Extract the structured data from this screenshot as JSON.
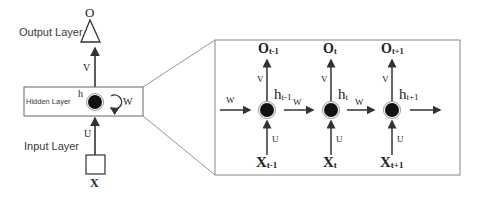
{
  "colors": {
    "line": "#333333",
    "frame": "#888888",
    "neuron_fill": "#111111",
    "neuron_ring": "#999999",
    "background": "#ffffff"
  },
  "folded": {
    "output_layer_label": "Output Layer",
    "hidden_layer_label": "Hidden Layer",
    "input_layer_label": "Input Layer",
    "output_symbol": "O",
    "hidden_symbol": "h",
    "input_symbol": "X",
    "weight_v": "V",
    "weight_u": "U",
    "weight_w": "W"
  },
  "unfolded": {
    "incoming_weight": "W",
    "steps": [
      {
        "output": "O",
        "output_sub": "t-1",
        "hidden": "h",
        "hidden_sub": "t-1",
        "input": "X",
        "input_sub": "t-1",
        "v": "V",
        "u": "U",
        "w_next": "W"
      },
      {
        "output": "O",
        "output_sub": "t",
        "hidden": "h",
        "hidden_sub": "t",
        "input": "X",
        "input_sub": "t",
        "v": "V",
        "u": "U",
        "w_next": "W"
      },
      {
        "output": "O",
        "output_sub": "t+1",
        "hidden": "h",
        "hidden_sub": "t+1",
        "input": "X",
        "input_sub": "t+1",
        "v": "V",
        "u": "U",
        "w_next": ""
      }
    ]
  }
}
